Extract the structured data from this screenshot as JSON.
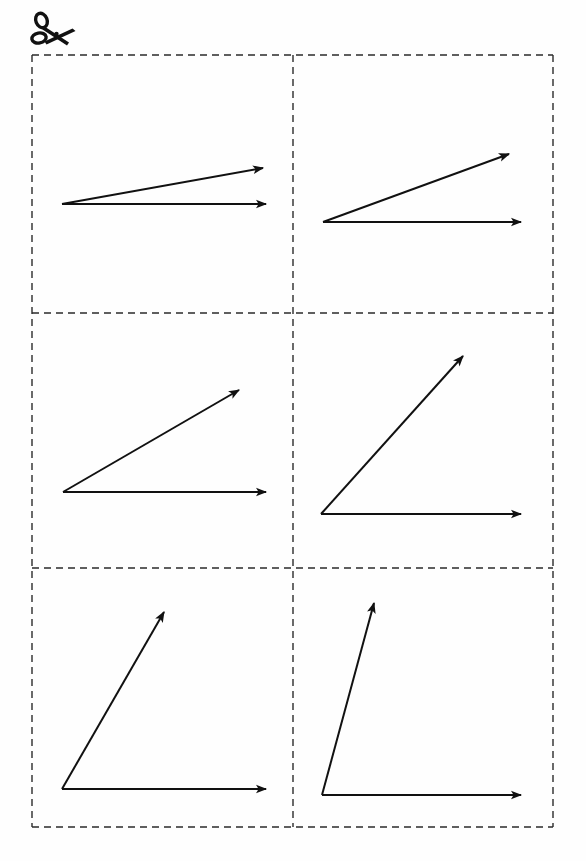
{
  "page": {
    "width": 586,
    "height": 861,
    "background_color": "#fefefe",
    "ink_color": "#111111"
  },
  "cut_icon": {
    "name": "scissors-icon",
    "glyph": "✂",
    "x": 58,
    "y": 32,
    "rotation_deg": 0
  },
  "grid": {
    "left": 32,
    "top": 55,
    "right": 553,
    "bottom": 827,
    "columns": 2,
    "rows": 3,
    "column_divider_x": [
      293
    ],
    "row_divider_y": [
      313,
      568
    ],
    "border_style": "dashed",
    "dash_pattern": "7 5",
    "stroke_width": 1.4,
    "stroke_color": "#2b2b2b"
  },
  "chart_data": {
    "type": "scatter",
    "xlabel": "",
    "ylabel": "",
    "grid": true,
    "legend": "none",
    "categories": [
      "card-1",
      "card-2",
      "card-3",
      "card-4",
      "card-5",
      "card-6"
    ],
    "values": [
      10,
      20,
      30,
      45,
      60,
      75
    ],
    "series": [
      {
        "name": "angle_degrees",
        "values": [
          10,
          20,
          30,
          45,
          60,
          75
        ]
      }
    ]
  },
  "cards": [
    {
      "id": "card-1",
      "index": 1,
      "row": 1,
      "column": 1,
      "angle_degrees": 10,
      "vertex": {
        "x": 62,
        "y": 204
      },
      "horizontal_ray": {
        "tip_x": 266,
        "tip_y": 204,
        "length": 204
      },
      "angled_ray": {
        "tip_x": 263,
        "tip_y": 168,
        "length": 204
      },
      "arrowheads": 2
    },
    {
      "id": "card-2",
      "index": 2,
      "row": 1,
      "column": 2,
      "angle_degrees": 20,
      "vertex": {
        "x": 323,
        "y": 222
      },
      "horizontal_ray": {
        "tip_x": 521,
        "tip_y": 222,
        "length": 198
      },
      "angled_ray": {
        "tip_x": 509,
        "tip_y": 154,
        "length": 198
      },
      "arrowheads": 2
    },
    {
      "id": "card-3",
      "index": 3,
      "row": 2,
      "column": 1,
      "angle_degrees": 30,
      "vertex": {
        "x": 63,
        "y": 492
      },
      "horizontal_ray": {
        "tip_x": 266,
        "tip_y": 492,
        "length": 203
      },
      "angled_ray": {
        "tip_x": 239,
        "tip_y": 390,
        "length": 203
      },
      "arrowheads": 2
    },
    {
      "id": "card-4",
      "index": 4,
      "row": 2,
      "column": 2,
      "angle_degrees": 45,
      "vertex": {
        "x": 321,
        "y": 514
      },
      "horizontal_ray": {
        "tip_x": 521,
        "tip_y": 514,
        "length": 200
      },
      "angled_ray": {
        "tip_x": 463,
        "tip_y": 356,
        "length": 200
      },
      "arrowheads": 2
    },
    {
      "id": "card-5",
      "index": 5,
      "row": 3,
      "column": 1,
      "angle_degrees": 60,
      "vertex": {
        "x": 62,
        "y": 789
      },
      "horizontal_ray": {
        "tip_x": 266,
        "tip_y": 789,
        "length": 204
      },
      "angled_ray": {
        "tip_x": 164,
        "tip_y": 612,
        "length": 204
      },
      "arrowheads": 2
    },
    {
      "id": "card-6",
      "index": 6,
      "row": 3,
      "column": 2,
      "angle_degrees": 75,
      "vertex": {
        "x": 322,
        "y": 795
      },
      "horizontal_ray": {
        "tip_x": 521,
        "tip_y": 795,
        "length": 199
      },
      "angled_ray": {
        "tip_x": 374,
        "tip_y": 603,
        "length": 199
      },
      "arrowheads": 2
    }
  ]
}
